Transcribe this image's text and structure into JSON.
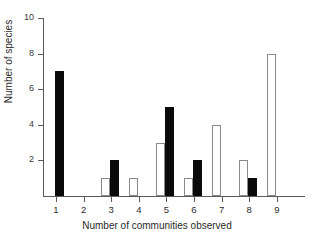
{
  "chart_data": {
    "type": "bar",
    "title": "",
    "subtitle": "",
    "xlabel": "Number of communities observed",
    "ylabel": "Number of species",
    "categories": [
      "1",
      "2",
      "3",
      "4",
      "5",
      "6",
      "7",
      "8",
      "9"
    ],
    "x": [
      1,
      2,
      3,
      4,
      5,
      6,
      7,
      8,
      9
    ],
    "series": [
      {
        "name": "open",
        "style": "open-bar",
        "color": "#ffffff",
        "edge_color": "#8a8a8a",
        "values": [
          0,
          0,
          1,
          1,
          3,
          1,
          4,
          2,
          8
        ]
      },
      {
        "name": "filled",
        "style": "filled-bar",
        "color": "#0a0a0a",
        "edge_color": "#0a0a0a",
        "values": [
          7,
          0,
          2,
          0,
          5,
          2,
          0,
          1,
          0
        ]
      }
    ],
    "ylim": [
      0,
      10
    ],
    "xlim": [
      0.4,
      9.6
    ],
    "yticks": [
      2,
      4,
      6,
      8,
      10
    ],
    "ytick_labels": [
      "2",
      "4",
      "6",
      "8",
      "10"
    ],
    "xticks": [
      1,
      2,
      3,
      4,
      5,
      6,
      7,
      8,
      9
    ],
    "xtick_labels": [
      "1",
      "2",
      "3",
      "4",
      "5",
      "6",
      "7",
      "8",
      "9"
    ],
    "grid": false,
    "legend": false,
    "legend_position": "none",
    "annotations": []
  },
  "layout": {
    "background": "#ffffff",
    "axis_color": "#5a5a5a",
    "text_color": "#2a2a2a"
  }
}
